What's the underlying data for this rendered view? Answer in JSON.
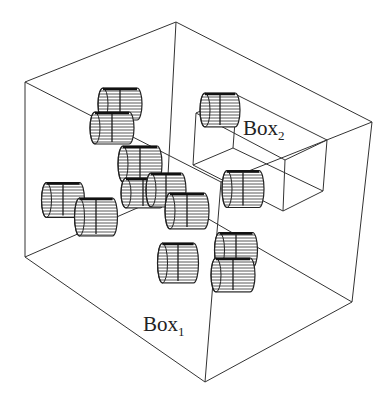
{
  "figure": {
    "title": "",
    "labels": {
      "box1": {
        "base": "Box",
        "sub": "1"
      },
      "box2": {
        "base": "Box",
        "sub": "2"
      }
    },
    "outer_box": {
      "name": "Box1",
      "vertices": {
        "top_left": [
          25,
          82
        ],
        "top_back": [
          176,
          22
        ],
        "top_right": [
          372,
          122
        ],
        "top_front": [
          221,
          182
        ],
        "bottom_left": [
          25,
          257
        ],
        "bottom_back": [
          167,
          195
        ],
        "bottom_right": [
          352,
          302
        ],
        "bottom_front": [
          205,
          382
        ]
      }
    },
    "inner_box": {
      "name": "Box2",
      "vertices": {
        "top_left": [
          196,
          113
        ],
        "top_back": [
          237,
          95
        ],
        "top_right": [
          327,
          140
        ],
        "top_front": [
          285,
          160
        ],
        "bottom_left": [
          193,
          165
        ],
        "bottom_back": [
          233,
          148
        ],
        "bottom_right": [
          323,
          191
        ],
        "bottom_front": [
          283,
          211
        ]
      }
    },
    "cylinders": [
      {
        "cx": 120,
        "cy": 104,
        "w": 44,
        "h": 32
      },
      {
        "cx": 112,
        "cy": 128,
        "w": 44,
        "h": 32
      },
      {
        "cx": 140,
        "cy": 164,
        "w": 44,
        "h": 36
      },
      {
        "cx": 143,
        "cy": 193,
        "w": 44,
        "h": 30
      },
      {
        "cx": 166,
        "cy": 190,
        "w": 40,
        "h": 34
      },
      {
        "cx": 187,
        "cy": 211,
        "w": 44,
        "h": 36
      },
      {
        "cx": 63,
        "cy": 200,
        "w": 43,
        "h": 35
      },
      {
        "cx": 96,
        "cy": 217,
        "w": 43,
        "h": 38
      },
      {
        "cx": 178,
        "cy": 263,
        "w": 41,
        "h": 40
      },
      {
        "cx": 236,
        "cy": 250,
        "w": 43,
        "h": 35
      },
      {
        "cx": 233,
        "cy": 275,
        "w": 44,
        "h": 34
      },
      {
        "cx": 220,
        "cy": 110,
        "w": 40,
        "h": 34
      },
      {
        "cx": 243,
        "cy": 189,
        "w": 42,
        "h": 37
      }
    ]
  }
}
